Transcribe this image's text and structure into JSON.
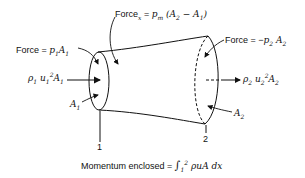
{
  "diagram": {
    "type": "control-volume-momentum",
    "labels": {
      "force_x_prefix": "Force",
      "force_x_sub": "x",
      "force_x_eq": " = ",
      "force_x_expr": "p",
      "force_x_expr_sub": "m",
      "force_x_paren": "(A",
      "force_x_a2sub": "2",
      "force_x_minus": " − A",
      "force_x_a1sub": "1",
      "force_x_close": ")",
      "force1_prefix": "Force = ",
      "force1_p": "p",
      "force1_psub": "1",
      "force1_A": "A",
      "force1_Asub": "1",
      "mom1_rho": "ρ",
      "mom1_rhosub": "1",
      "mom1_u": " u",
      "mom1_usub": "1",
      "mom1_sup": "2",
      "mom1_A": "A",
      "mom1_Asub": "1",
      "force2_prefix": "Force = −",
      "force2_p": "p",
      "force2_psub": "2",
      "force2_A": " A",
      "force2_Asub": "2",
      "mom2_rho": "ρ",
      "mom2_rhosub": "2",
      "mom2_u": " u",
      "mom2_usub": "2",
      "mom2_sup": "2",
      "mom2_A": "A",
      "mom2_Asub": "2",
      "area1": "A",
      "area1_sub": "1",
      "area2": "A",
      "area2_sub": "2",
      "section1": "1",
      "section2": "2",
      "momentum_prefix": "Momentum enclosed = ",
      "momentum_int": "∫",
      "momentum_lower": "1",
      "momentum_upper": "2",
      "momentum_expr": " ρuA dx"
    }
  }
}
